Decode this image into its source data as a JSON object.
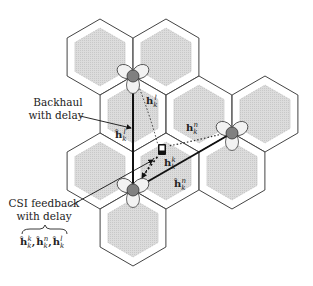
{
  "diagram": {
    "cells": [
      {
        "id": "cell-1"
      },
      {
        "id": "cell-2"
      },
      {
        "id": "cell-3"
      },
      {
        "id": "cell-4"
      },
      {
        "id": "cell-5"
      },
      {
        "id": "cell-6"
      },
      {
        "id": "cell-7"
      },
      {
        "id": "cell-8"
      },
      {
        "id": "cell-9"
      }
    ],
    "base_stations": [
      {
        "id": "bs-l",
        "name": "base-station-l"
      },
      {
        "id": "bs-n",
        "name": "base-station-n"
      },
      {
        "id": "bs-k",
        "name": "base-station-k"
      }
    ],
    "user": {
      "name": "user-terminal",
      "icon": "mobile-phone-icon"
    },
    "channels": {
      "h_l": {
        "base": "h",
        "sub": "k",
        "sup": "l"
      },
      "h_n": {
        "base": "h",
        "sub": "k",
        "sup": "n"
      },
      "h_k": {
        "base": "h",
        "sub": "k",
        "sup": "k"
      },
      "hhat_l": {
        "base": "ĥ",
        "sub": "k",
        "sup": "l"
      },
      "hhat_n": {
        "base": "ĥ",
        "sub": "k",
        "sup": "n"
      }
    },
    "labels": {
      "backhaul_line1": "Backhaul",
      "backhaul_line2": "with delay",
      "csi_line1": "CSI feedback",
      "csi_line2": "with delay",
      "csi_set_h": "ĥ",
      "csi_set_sub": "k",
      "csi_set_sup1": "k",
      "csi_set_sup2": "n",
      "csi_set_sup3": "l",
      "comma": ","
    },
    "colors": {
      "cell_fill": "#d9d9d9",
      "cell_stroke": "#444444",
      "bs_node": "#808080",
      "backhaul": "#111111"
    }
  }
}
